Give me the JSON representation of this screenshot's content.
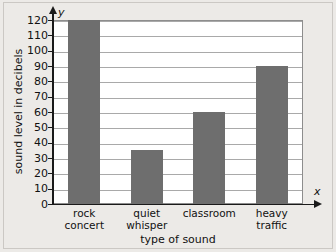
{
  "chart_data": {
    "type": "bar",
    "title": "",
    "xlabel": "type of sound",
    "ylabel": "sound level in decibels",
    "x_axis_variable": "x",
    "y_axis_variable": "y",
    "categories": [
      "rock concert",
      "quiet whisper",
      "classroom",
      "heavy traffic"
    ],
    "category_lines": [
      [
        "rock",
        "concert"
      ],
      [
        "quiet",
        "whisper"
      ],
      [
        "classroom",
        ""
      ],
      [
        "heavy",
        "traffic"
      ]
    ],
    "values": [
      120,
      35,
      60,
      90
    ],
    "ylim": [
      0,
      120
    ],
    "ytick_step": 10,
    "yticks": [
      0,
      10,
      20,
      30,
      40,
      50,
      60,
      70,
      80,
      90,
      100,
      110,
      120
    ],
    "grid": true,
    "legend": false,
    "bar_color": "#6e6e6e",
    "plot_background": "#ffffff",
    "gridline_color": "#a9a9a9",
    "axis_color": "#1a1a1a",
    "page_background": "#eceae7"
  }
}
